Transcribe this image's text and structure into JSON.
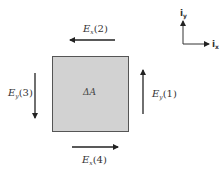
{
  "diagram": {
    "element": {
      "label": "ΔA",
      "fill": "#d2d2d2",
      "stroke": "#555555"
    },
    "arrows": [
      {
        "id": "ey1",
        "symbol": "E",
        "subscript": "y",
        "index": "(1)",
        "direction": "up"
      },
      {
        "id": "ex2",
        "symbol": "E",
        "subscript": "x",
        "index": "(2)",
        "direction": "left"
      },
      {
        "id": "ey3",
        "symbol": "E",
        "subscript": "y",
        "index": "(3)",
        "direction": "down"
      },
      {
        "id": "ex4",
        "symbol": "E",
        "subscript": "x",
        "index": "(4)",
        "direction": "right"
      }
    ],
    "axes": {
      "y": {
        "base": "i",
        "subscript": "y"
      },
      "x": {
        "base": "i",
        "subscript": "x"
      }
    },
    "arrow_color": "#222222"
  }
}
